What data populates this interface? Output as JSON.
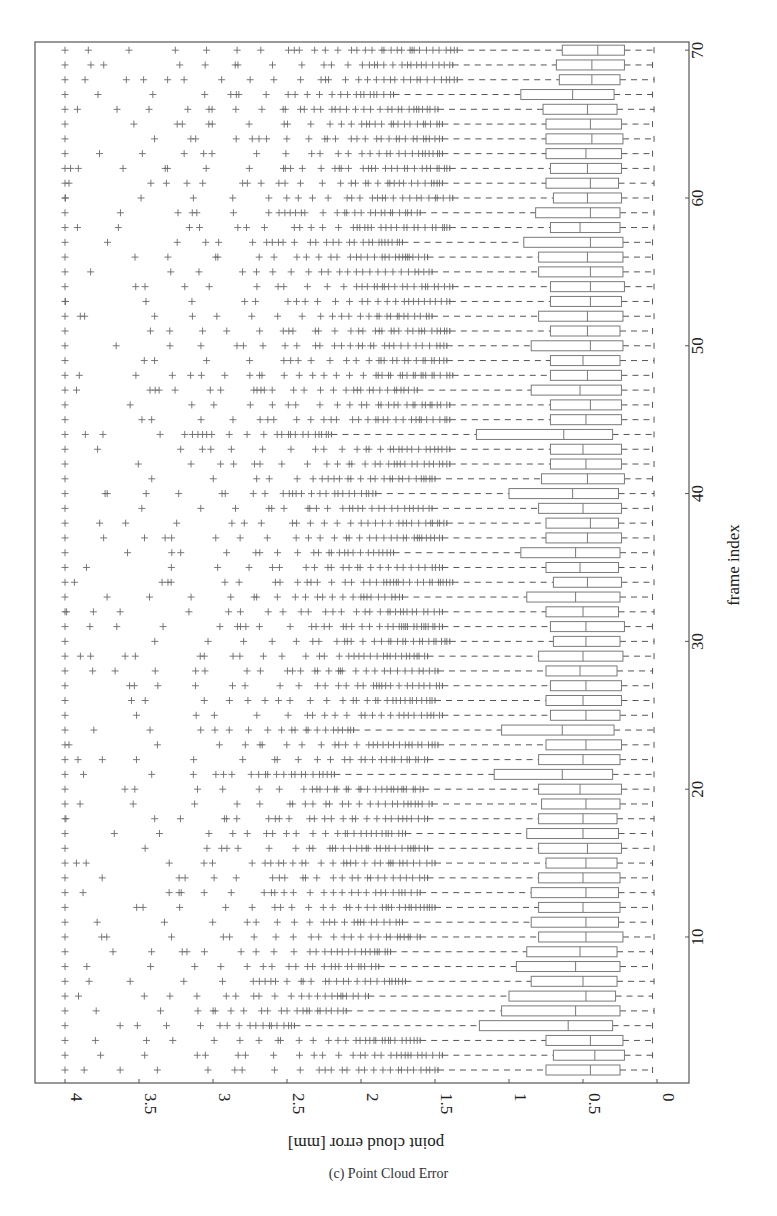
{
  "caption": "(c) Point Cloud Error",
  "chart_data": {
    "type": "box",
    "orientation": "rotated-90",
    "title": "(c) Point Cloud Error",
    "xlabel": "frame index",
    "ylabel": "point cloud error [mm]",
    "x_ticks": [
      10,
      20,
      30,
      40,
      50,
      60,
      70
    ],
    "y_ticks": [
      0,
      0.5,
      1,
      1.5,
      2,
      2.5,
      3,
      3.5,
      4
    ],
    "y_tick_labels": [
      "0",
      "0.5",
      "1",
      "1.5",
      "2",
      "2.5",
      "3",
      "3.5",
      "4"
    ],
    "xlim": [
      0.5,
      70.5
    ],
    "ylim": [
      0,
      4
    ],
    "grid": false,
    "outlier_marker": "+",
    "frames": [
      1,
      2,
      3,
      4,
      5,
      6,
      7,
      8,
      9,
      10,
      11,
      12,
      13,
      14,
      15,
      16,
      17,
      18,
      19,
      20,
      21,
      22,
      23,
      24,
      25,
      26,
      27,
      28,
      29,
      30,
      31,
      32,
      33,
      34,
      35,
      36,
      37,
      38,
      39,
      40,
      41,
      42,
      43,
      44,
      45,
      46,
      47,
      48,
      49,
      50,
      51,
      52,
      53,
      54,
      55,
      56,
      57,
      58,
      59,
      60,
      61,
      62,
      63,
      64,
      65,
      66,
      67,
      68,
      69,
      70
    ],
    "q1": [
      0.25,
      0.22,
      0.23,
      0.3,
      0.25,
      0.28,
      0.27,
      0.25,
      0.27,
      0.23,
      0.26,
      0.25,
      0.26,
      0.25,
      0.27,
      0.24,
      0.26,
      0.27,
      0.25,
      0.24,
      0.3,
      0.25,
      0.24,
      0.29,
      0.25,
      0.24,
      0.24,
      0.27,
      0.23,
      0.25,
      0.22,
      0.26,
      0.25,
      0.24,
      0.26,
      0.25,
      0.24,
      0.26,
      0.24,
      0.26,
      0.22,
      0.24,
      0.24,
      0.3,
      0.24,
      0.24,
      0.24,
      0.24,
      0.25,
      0.23,
      0.25,
      0.23,
      0.24,
      0.22,
      0.23,
      0.23,
      0.23,
      0.25,
      0.25,
      0.24,
      0.26,
      0.24,
      0.24,
      0.23,
      0.24,
      0.27,
      0.29,
      0.25,
      0.22,
      0.22
    ],
    "median": [
      0.45,
      0.42,
      0.45,
      0.6,
      0.55,
      0.48,
      0.5,
      0.55,
      0.52,
      0.48,
      0.48,
      0.5,
      0.48,
      0.5,
      0.48,
      0.47,
      0.5,
      0.5,
      0.48,
      0.52,
      0.64,
      0.5,
      0.48,
      0.64,
      0.48,
      0.5,
      0.48,
      0.52,
      0.5,
      0.48,
      0.48,
      0.5,
      0.55,
      0.47,
      0.52,
      0.55,
      0.47,
      0.45,
      0.5,
      0.57,
      0.47,
      0.48,
      0.5,
      0.63,
      0.48,
      0.45,
      0.52,
      0.47,
      0.5,
      0.45,
      0.47,
      0.47,
      0.45,
      0.45,
      0.45,
      0.47,
      0.45,
      0.52,
      0.45,
      0.47,
      0.45,
      0.47,
      0.48,
      0.44,
      0.45,
      0.47,
      0.57,
      0.44,
      0.44,
      0.4
    ],
    "q3": [
      0.75,
      0.7,
      0.75,
      1.2,
      1.05,
      1.0,
      0.85,
      0.95,
      0.88,
      0.8,
      0.85,
      0.8,
      0.85,
      0.8,
      0.75,
      0.8,
      0.88,
      0.8,
      0.78,
      0.8,
      1.1,
      0.8,
      0.75,
      1.05,
      0.72,
      0.75,
      0.72,
      0.75,
      0.8,
      0.7,
      0.72,
      0.75,
      0.88,
      0.7,
      0.75,
      0.92,
      0.75,
      0.75,
      0.8,
      1.0,
      0.78,
      0.72,
      0.72,
      1.22,
      0.72,
      0.72,
      0.85,
      0.72,
      0.72,
      0.85,
      0.72,
      0.8,
      0.72,
      0.72,
      0.8,
      0.8,
      0.9,
      0.72,
      0.82,
      0.7,
      0.75,
      0.72,
      0.75,
      0.75,
      0.75,
      0.77,
      0.92,
      0.66,
      0.68,
      0.64
    ],
    "whisker_low": [
      0.03,
      0.03,
      0.03,
      0.03,
      0.02,
      0.03,
      0.02,
      0.03,
      0.03,
      0.02,
      0.03,
      0.03,
      0.02,
      0.03,
      0.03,
      0.02,
      0.03,
      0.02,
      0.03,
      0.02,
      0.02,
      0.03,
      0.02,
      0.02,
      0.03,
      0.02,
      0.03,
      0.03,
      0.02,
      0.02,
      0.03,
      0.02,
      0.03,
      0.02,
      0.03,
      0.02,
      0.02,
      0.03,
      0.03,
      0.02,
      0.03,
      0.02,
      0.03,
      0.02,
      0.02,
      0.03,
      0.02,
      0.03,
      0.02,
      0.02,
      0.03,
      0.02,
      0.03,
      0.02,
      0.02,
      0.03,
      0.03,
      0.02,
      0.02,
      0.03,
      0.02,
      0.02,
      0.03,
      0.02,
      0.03,
      0.02,
      0.03,
      0.02,
      0.03,
      0.02
    ],
    "whisker_high": [
      1.48,
      1.45,
      1.6,
      2.45,
      2.1,
      1.95,
      1.7,
      1.88,
      1.8,
      1.6,
      1.72,
      1.5,
      1.6,
      1.55,
      1.5,
      1.55,
      1.7,
      1.55,
      1.52,
      1.58,
      2.18,
      1.55,
      1.48,
      2.05,
      1.45,
      1.5,
      1.45,
      1.48,
      1.55,
      1.4,
      1.45,
      1.45,
      1.72,
      1.38,
      1.45,
      1.78,
      1.45,
      1.42,
      1.52,
      1.9,
      1.5,
      1.4,
      1.4,
      2.2,
      1.4,
      1.4,
      1.62,
      1.38,
      1.42,
      1.42,
      1.4,
      1.52,
      1.4,
      1.38,
      1.52,
      1.55,
      1.72,
      1.4,
      1.6,
      1.38,
      1.45,
      1.4,
      1.45,
      1.45,
      1.45,
      1.48,
      1.78,
      1.35,
      1.38,
      1.35
    ],
    "outliers_max": 4.0,
    "outlier_density": 0.55
  },
  "colors": {
    "frame": "#555555",
    "box": "#7a7a7a",
    "whisker": "#555555",
    "outlier": "#6a6a6a",
    "text": "#222222"
  }
}
